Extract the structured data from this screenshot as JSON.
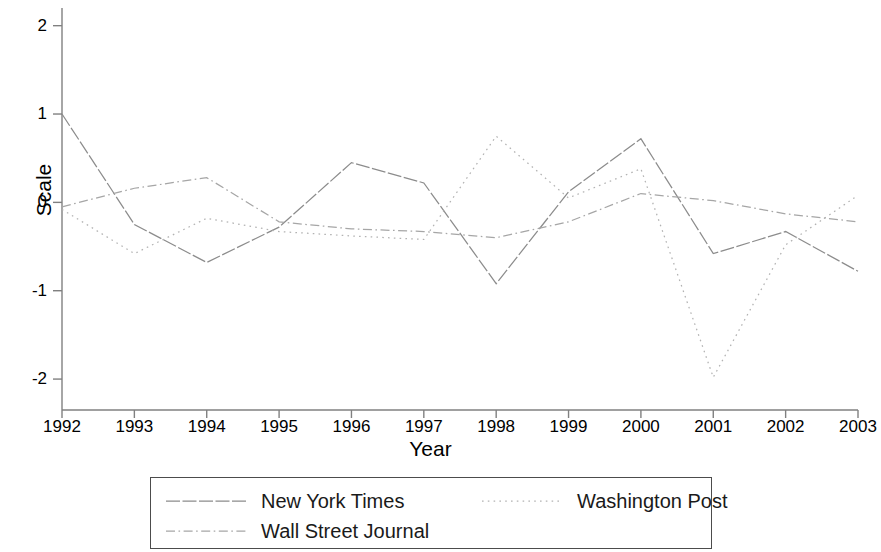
{
  "chart_data": {
    "type": "line",
    "title": "",
    "xlabel": "Year",
    "ylabel": "Scale",
    "x": [
      1992,
      1993,
      1994,
      1995,
      1996,
      1997,
      1998,
      1999,
      2000,
      2001,
      2002,
      2003
    ],
    "xticklabels": [
      "1992",
      "1993",
      "1994",
      "1995",
      "1996",
      "1997",
      "1998",
      "1999",
      "2000",
      "2001",
      "2002",
      "2003"
    ],
    "yticklabels": [
      "2",
      "1",
      "0",
      "-1",
      "-2"
    ],
    "yticks": [
      2,
      1,
      0,
      -1,
      -2
    ],
    "xlim": [
      1992,
      2003
    ],
    "ylim": [
      -2.35,
      2.2
    ],
    "grid": false,
    "legend_position": "bottom",
    "series": [
      {
        "name": "New York Times",
        "style": "solid",
        "color": "#8c8c8c",
        "values": [
          1.0,
          -0.25,
          -0.68,
          -0.28,
          0.45,
          0.22,
          -0.92,
          0.12,
          0.72,
          -0.58,
          -0.33,
          -0.78
        ]
      },
      {
        "name": "Washington Post",
        "style": "dotted",
        "color": "#b2b2b2",
        "values": [
          -0.08,
          -0.58,
          -0.18,
          -0.33,
          -0.38,
          -0.42,
          0.75,
          0.05,
          0.38,
          -1.98,
          -0.48,
          0.08
        ]
      },
      {
        "name": "Wall Street Journal",
        "style": "dashdot",
        "color": "#a6a6a6",
        "values": [
          -0.05,
          0.16,
          0.28,
          -0.22,
          -0.3,
          -0.33,
          -0.4,
          -0.22,
          0.1,
          0.02,
          -0.13,
          -0.22
        ]
      }
    ]
  },
  "legend": {
    "entries": [
      {
        "label": "New York Times"
      },
      {
        "label": "Washington Post"
      },
      {
        "label": "Wall Street Journal"
      }
    ]
  }
}
